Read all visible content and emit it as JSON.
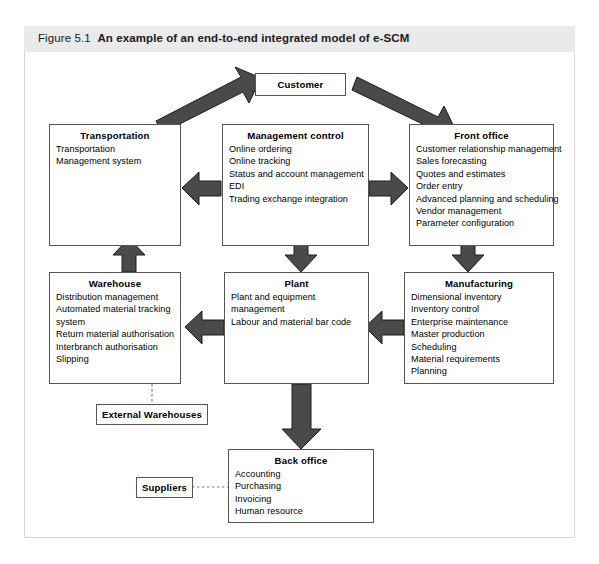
{
  "figure": {
    "number": "Figure 5.1",
    "title": "An example of an end-to-end integrated model of e-SCM",
    "colors": {
      "caption_band": "#eaeaea",
      "frame_border": "#d7d7d7",
      "box_border": "#555555",
      "arrow_fill": "#4a4a4a",
      "arrow_stroke": "#1c1c1c",
      "text": "#000000"
    }
  },
  "nodes": {
    "customer": {
      "title": "Customer",
      "items": []
    },
    "transportation": {
      "title": "Transportation",
      "items": [
        "Transportation",
        "Management system"
      ]
    },
    "management_control": {
      "title": "Management control",
      "items": [
        "Online ordering",
        "Online tracking",
        "Status and account management",
        "EDI",
        "Trading exchange integration"
      ]
    },
    "front_office": {
      "title": "Front office",
      "items": [
        "Customer relationship management",
        "Sales forecasting",
        "Quotes and estimates",
        "Order entry",
        "Advanced planning and scheduling",
        "Vendor management",
        "Parameter configuration"
      ]
    },
    "warehouse": {
      "title": "Warehouse",
      "items": [
        "Distribution management",
        "Automated material tracking",
        "system",
        "Return material authorisation",
        "Interbranch authorisation",
        "Slipping"
      ]
    },
    "plant": {
      "title": "Plant",
      "items": [
        "Plant and equipment",
        "management",
        "Labour and material bar code"
      ]
    },
    "manufacturing": {
      "title": "Manufacturing",
      "items": [
        "Dimensional inventory",
        "Inventory control",
        "Enterprise maintenance",
        "Master production",
        "Scheduling",
        "Material requirements",
        "Planning"
      ]
    },
    "external_warehouses": {
      "title": "External Warehouses",
      "items": []
    },
    "back_office": {
      "title": "Back office",
      "items": [
        "Accounting",
        "Purchasing",
        "Invoicing",
        "Human resource"
      ]
    },
    "suppliers": {
      "title": "Suppliers",
      "items": []
    }
  },
  "connections": [
    {
      "name": "transportation-to-customer",
      "from": "transportation",
      "to": "customer",
      "style": "solid-block",
      "direction": "up-right"
    },
    {
      "name": "customer-to-front-office",
      "from": "customer",
      "to": "front_office",
      "style": "solid-block",
      "direction": "down-right"
    },
    {
      "name": "management-control-to-transportation",
      "from": "management_control",
      "to": "transportation",
      "style": "solid-block",
      "direction": "left"
    },
    {
      "name": "management-control-to-front-office",
      "from": "management_control",
      "to": "front_office",
      "style": "solid-block",
      "direction": "right"
    },
    {
      "name": "warehouse-to-transportation",
      "from": "warehouse",
      "to": "transportation",
      "style": "solid-block",
      "direction": "up"
    },
    {
      "name": "management-control-to-plant",
      "from": "management_control",
      "to": "plant",
      "style": "solid-block",
      "direction": "down"
    },
    {
      "name": "front-office-to-manufacturing",
      "from": "front_office",
      "to": "manufacturing",
      "style": "solid-block",
      "direction": "down"
    },
    {
      "name": "plant-to-warehouse",
      "from": "plant",
      "to": "warehouse",
      "style": "solid-block",
      "direction": "left"
    },
    {
      "name": "manufacturing-to-plant",
      "from": "manufacturing",
      "to": "plant",
      "style": "solid-block",
      "direction": "left"
    },
    {
      "name": "plant-to-back-office",
      "from": "plant",
      "to": "back_office",
      "style": "solid-block",
      "direction": "down"
    },
    {
      "name": "warehouse-to-external-warehouses",
      "from": "warehouse",
      "to": "external_warehouses",
      "style": "dashed-line",
      "direction": "down"
    },
    {
      "name": "suppliers-to-back-office",
      "from": "suppliers",
      "to": "back_office",
      "style": "dashed-line",
      "direction": "right"
    }
  ]
}
